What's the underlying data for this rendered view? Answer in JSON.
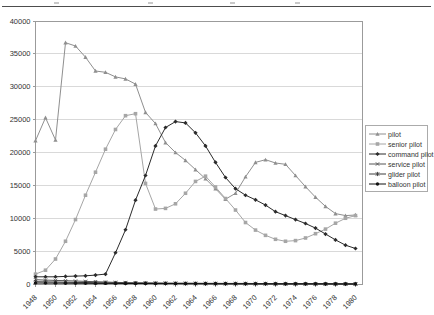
{
  "page": {
    "cropped_heading_text": "",
    "heading_rule_color": "#4d4d4d"
  },
  "colors": {
    "background": "#ffffff",
    "plot_border": "#9b9b9b",
    "gridline": "#d9d9d9",
    "tick_text": "#333333",
    "legend_border": "#ababab"
  },
  "chart_data": {
    "type": "line",
    "title": "",
    "xlabel": "",
    "ylabel": "",
    "ylim": [
      0,
      40000
    ],
    "yticks": [
      0,
      5000,
      10000,
      15000,
      20000,
      25000,
      30000,
      35000,
      40000
    ],
    "ytick_labels": [
      "0",
      "5000",
      "10000",
      "15000",
      "20000",
      "25000",
      "30000",
      "35000",
      "40000"
    ],
    "grid": "horizontal",
    "legend_position": "middle-right",
    "years": [
      1948,
      1949,
      1950,
      1951,
      1952,
      1953,
      1954,
      1955,
      1956,
      1957,
      1958,
      1959,
      1960,
      1961,
      1962,
      1963,
      1964,
      1965,
      1966,
      1967,
      1968,
      1969,
      1970,
      1971,
      1972,
      1973,
      1974,
      1975,
      1976,
      1977,
      1978,
      1979,
      1980
    ],
    "x_tick_labels": [
      "1948",
      "1950",
      "1952",
      "1954",
      "1956",
      "1958",
      "1960",
      "1962",
      "1964",
      "1966",
      "1968",
      "1970",
      "1972",
      "1974",
      "1976",
      "1978",
      "1980"
    ],
    "series": [
      {
        "name": "pilot",
        "marker": "triangle",
        "color": "#8f8f8f",
        "values": [
          21800,
          25300,
          21900,
          36700,
          36200,
          34500,
          32400,
          32200,
          31500,
          31200,
          30400,
          26100,
          24400,
          21500,
          20000,
          18800,
          17400,
          16000,
          14500,
          12900,
          13800,
          16300,
          18500,
          18900,
          18400,
          18200,
          16500,
          14800,
          13200,
          11800,
          10700,
          10400,
          10500
        ]
      },
      {
        "name": "senior pilot",
        "marker": "square",
        "color": "#a6a6a6",
        "values": [
          1500,
          2100,
          3800,
          6500,
          9800,
          13500,
          17000,
          20500,
          23500,
          25600,
          25900,
          15300,
          11400,
          11500,
          12200,
          13800,
          15600,
          16400,
          14750,
          13000,
          11250,
          9350,
          8200,
          7400,
          6800,
          6500,
          6600,
          7000,
          7650,
          8350,
          9250,
          10000,
          10400
        ]
      },
      {
        "name": "command pilot",
        "marker": "diamond",
        "color": "#2b2b2b",
        "values": [
          1100,
          1100,
          1100,
          1150,
          1200,
          1250,
          1350,
          1500,
          4750,
          8250,
          12750,
          16500,
          21000,
          23800,
          24700,
          24500,
          23000,
          21000,
          18500,
          16200,
          14500,
          13500,
          12800,
          12000,
          11000,
          10400,
          9800,
          9200,
          8500,
          7600,
          6700,
          5900,
          5400
        ]
      },
      {
        "name": "service pilot",
        "marker": "x",
        "color": "#555555",
        "values": [
          650,
          600,
          550,
          500,
          450,
          400,
          350,
          300,
          250,
          220,
          200,
          180,
          160,
          150,
          140,
          130,
          120,
          110,
          100,
          95,
          90,
          85,
          80,
          75,
          70,
          65,
          60,
          55,
          50,
          45,
          40,
          35,
          30
        ]
      },
      {
        "name": "glider pilot",
        "marker": "asterisk",
        "color": "#3d3d3d",
        "values": [
          350,
          320,
          300,
          280,
          250,
          230,
          200,
          180,
          150,
          130,
          110,
          100,
          90,
          80,
          70,
          60,
          55,
          50,
          45,
          40,
          35,
          30,
          28,
          25,
          22,
          20,
          18,
          16,
          14,
          12,
          10,
          8,
          6
        ]
      },
      {
        "name": "balloon pilot",
        "marker": "circle",
        "color": "#111111",
        "values": [
          150,
          140,
          130,
          120,
          110,
          100,
          95,
          90,
          85,
          80,
          75,
          70,
          65,
          60,
          55,
          50,
          45,
          40,
          35,
          30,
          28,
          25,
          22,
          20,
          18,
          16,
          14,
          12,
          10,
          8,
          6,
          5,
          4
        ]
      }
    ]
  }
}
